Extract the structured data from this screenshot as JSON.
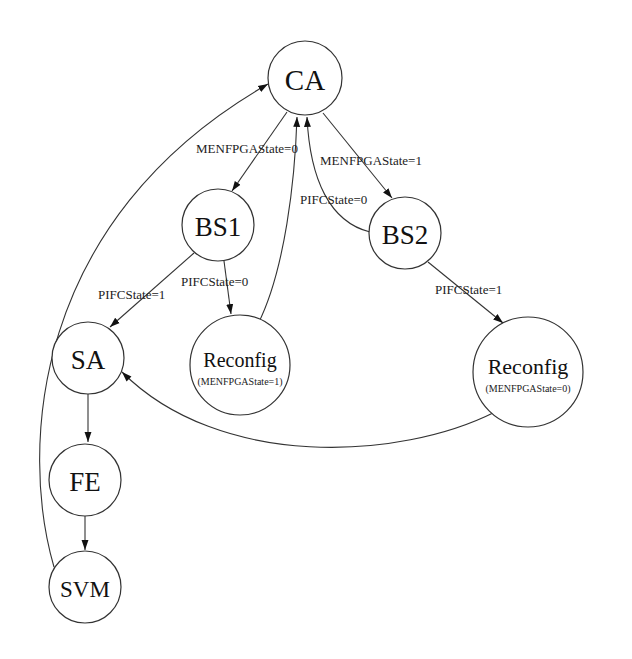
{
  "diagram": {
    "type": "state-machine",
    "nodes": [
      {
        "id": "CA",
        "label": "CA"
      },
      {
        "id": "BS1",
        "label": "BS1"
      },
      {
        "id": "BS2",
        "label": "BS2"
      },
      {
        "id": "SA",
        "label": "SA"
      },
      {
        "id": "Reconfig1",
        "label": "Reconfig",
        "sublabel": "(MENFPGAState=1)"
      },
      {
        "id": "Reconfig2",
        "label": "Reconfig",
        "sublabel": "(MENFPGAState=0)"
      },
      {
        "id": "FE",
        "label": "FE"
      },
      {
        "id": "SVM",
        "label": "SVM"
      }
    ],
    "edges": [
      {
        "from": "CA",
        "to": "BS1",
        "label": "MENFPGAState=0"
      },
      {
        "from": "CA",
        "to": "BS2",
        "label": "MENFPGAState=1"
      },
      {
        "from": "BS2",
        "to": "CA",
        "label": "PIFCState=0"
      },
      {
        "from": "BS1",
        "to": "SA",
        "label": "PIFCState=1"
      },
      {
        "from": "BS1",
        "to": "Reconfig1",
        "label": "PIFCState=0"
      },
      {
        "from": "Reconfig1",
        "to": "CA",
        "label": ""
      },
      {
        "from": "BS2",
        "to": "Reconfig2",
        "label": "PIFCState=1"
      },
      {
        "from": "Reconfig2",
        "to": "SA",
        "label": ""
      },
      {
        "from": "SA",
        "to": "FE",
        "label": ""
      },
      {
        "from": "FE",
        "to": "SVM",
        "label": ""
      },
      {
        "from": "SVM",
        "to": "CA",
        "label": ""
      }
    ]
  }
}
